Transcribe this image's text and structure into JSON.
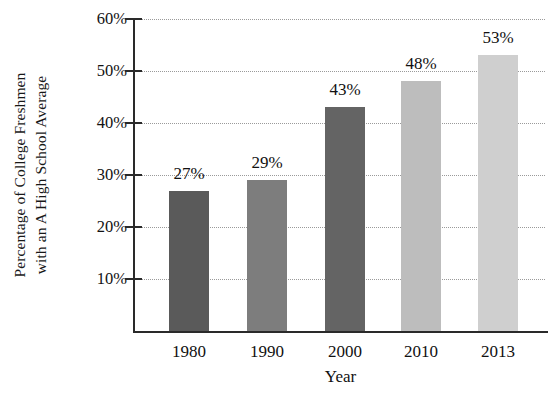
{
  "chart_data": {
    "type": "bar",
    "title": "",
    "xlabel": "Year",
    "ylabel": "Percentage of College Freshmen with an A High School Average",
    "ylabel_line1": "Percentage of College Freshmen",
    "ylabel_line2": "with an A High School Average",
    "categories": [
      "1980",
      "1990",
      "2000",
      "2010",
      "2013"
    ],
    "values": [
      27,
      29,
      43,
      48,
      53
    ],
    "value_labels": [
      "27%",
      "29%",
      "43%",
      "48%",
      "53%"
    ],
    "bar_colors": [
      "#5a5a5a",
      "#7d7d7d",
      "#646464",
      "#bdbdbd",
      "#cfcfcf"
    ],
    "ylim": [
      0,
      60
    ],
    "ytick_values": [
      60,
      50,
      40,
      30,
      20,
      10
    ],
    "ytick_labels": [
      "60%",
      "50%",
      "40%",
      "30%",
      "20%",
      "10%"
    ],
    "grid": "horizontal-dotted",
    "legend": "none",
    "axis_color": "#2a2a2a",
    "grid_color": "#9a9a9a",
    "background": "#ffffff"
  }
}
